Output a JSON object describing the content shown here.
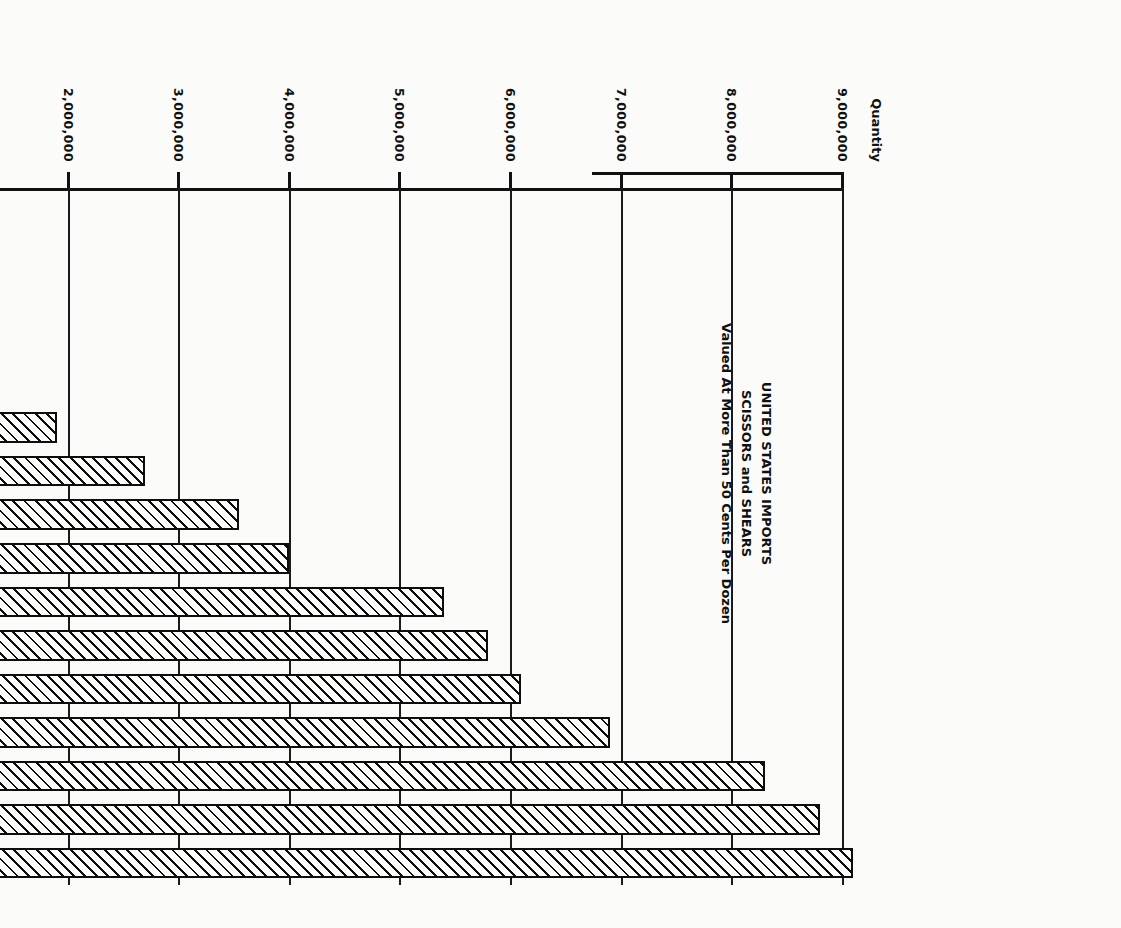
{
  "page": {
    "orientation": "rotated-90-clockwise",
    "background": "#fbfbf9",
    "ink": "#101010"
  },
  "chart_data": {
    "type": "bar",
    "orientation": "vertical-printed-sideways",
    "title": "UNITED STATES IMPORTS",
    "subtitle": "SCISSORS and SHEARS",
    "subtitle2": "Valued At More Than 50 Cents Per Dozen",
    "ylabel": "Quantity",
    "xlabel": "",
    "ylim": [
      0,
      9000000
    ],
    "grid": true,
    "legend": null,
    "ytick_labels": [
      "9,000,000",
      "8,000,000",
      "7,000,000",
      "6,000,000",
      "5,000,000",
      "4,000,000",
      "3,000,000",
      "2,000,000",
      "1,000,000",
      "0"
    ],
    "ytick_values": [
      9000000,
      8000000,
      7000000,
      6000000,
      5000000,
      4000000,
      3000000,
      2000000,
      1000000,
      0
    ],
    "categories": [
      "Average\n1931-1940",
      "1947",
      "48",
      "49",
      "50",
      "51",
      "52",
      "53",
      "54",
      "55",
      "56",
      "57",
      "58",
      "59",
      "60",
      "61"
    ],
    "category_labels": [
      "Average 1931-1940",
      "1947",
      "48",
      "49",
      "50",
      "51",
      "52",
      "53",
      "54",
      "55",
      "56",
      "57",
      "58",
      "59",
      "60",
      "61"
    ],
    "values": [
      0,
      80000,
      200000,
      350000,
      1100000,
      1900000,
      2700000,
      3550000,
      4000000,
      5400000,
      5800000,
      6100000,
      6900000,
      8300000,
      8800000,
      9100000
    ],
    "annotations": [
      "Average 1931-1940 period shown at axis origin"
    ]
  },
  "axis": {
    "quantity_title": "Quantity",
    "average_label_line1": "Average",
    "average_label_line2": "1931-1940",
    "zero_label": "0"
  },
  "title": {
    "line1": "UNITED STATES IMPORTS",
    "line2": "SCISSORS and SHEARS",
    "line3": "Valued At More Than 50 Cents Per Dozen"
  }
}
